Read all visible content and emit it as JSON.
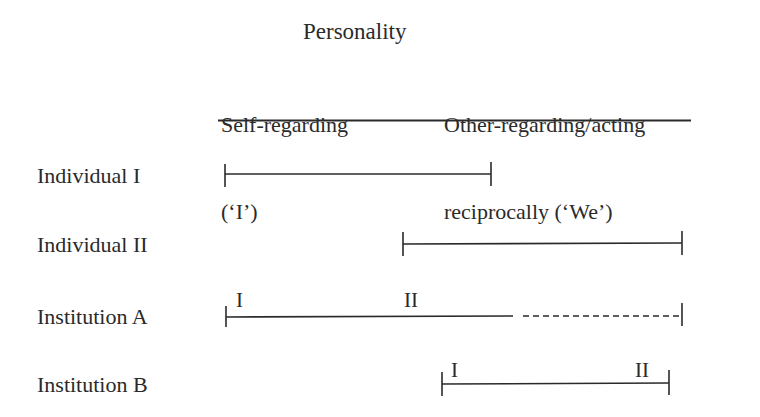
{
  "diagram": {
    "title": "Personality",
    "columns": [
      {
        "line1": "Self-regarding",
        "line2": "(‘I’)"
      },
      {
        "line1": "Other-regarding/acting",
        "line2": "reciprocally (‘We’)"
      }
    ],
    "rows": [
      {
        "label": "Individual I",
        "segment": {
          "start": 225,
          "end": 491,
          "style": "solid"
        }
      },
      {
        "label": "Individual II",
        "segment": {
          "start": 403,
          "end": 682,
          "style": "solid"
        }
      },
      {
        "label": "Institution A",
        "segment": {
          "start": 226,
          "solid_end": 513,
          "dashed_end": 682,
          "style": "solid-then-dashed"
        },
        "markers": [
          {
            "text": "I"
          },
          {
            "text": "II"
          }
        ]
      },
      {
        "label": "Institution B",
        "segment": {
          "start": 442,
          "end": 669,
          "style": "solid"
        },
        "markers": [
          {
            "text": "I"
          },
          {
            "text": "II"
          }
        ]
      }
    ],
    "line_color": "#2a2a2a"
  }
}
